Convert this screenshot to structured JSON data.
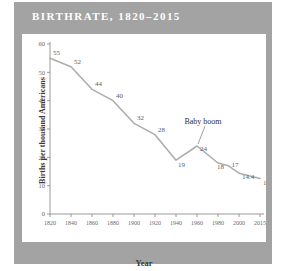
{
  "figure": {
    "title": "BIRTHRATE, 1820–2015",
    "frame_color": "#a3a3a3",
    "card_color": "#ffffff",
    "title_color": "#ffffff"
  },
  "chart_data": {
    "type": "line",
    "title": "BIRTHRATE, 1820–2015",
    "xlabel": "Year",
    "ylabel": "Births per thousand Americans",
    "xlim": [
      1820,
      2015
    ],
    "ylim": [
      0,
      60
    ],
    "grid": false,
    "legend": null,
    "line_color": "#adadad",
    "xticks": [
      "1820",
      "1840",
      "1860",
      "1880",
      "1900",
      "1920",
      "1940",
      "1960",
      "1980",
      "2000",
      "2015"
    ],
    "yticks": [
      "0",
      "10",
      "20",
      "30",
      "40",
      "50",
      "60"
    ],
    "x": [
      1820,
      1840,
      1860,
      1880,
      1900,
      1920,
      1940,
      1960,
      1980,
      1990,
      2000,
      2015
    ],
    "values": [
      55,
      52,
      44,
      40,
      32,
      28,
      19,
      24,
      18,
      17,
      14.4,
      12.5
    ],
    "point_labels": [
      "55",
      "52",
      "44",
      "40",
      "32",
      "28",
      "19",
      "24",
      "18",
      "17",
      "14.4",
      "12.5"
    ],
    "annotations": [
      {
        "text": "Baby boom",
        "target_x": 1960,
        "target_y": 24
      }
    ]
  }
}
